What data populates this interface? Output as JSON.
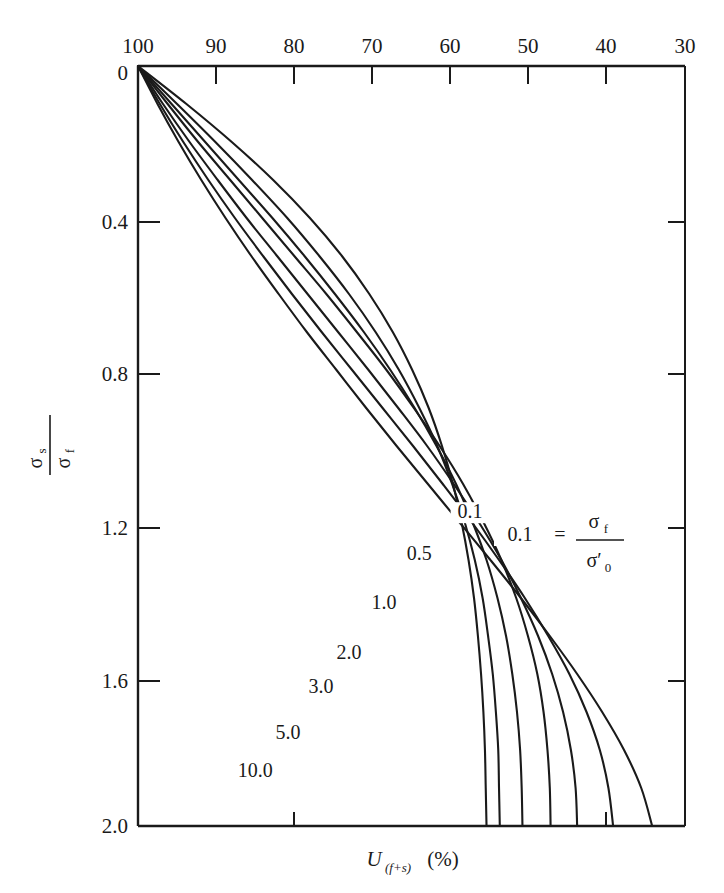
{
  "chart_data": {
    "type": "line",
    "title": "",
    "xlabel": "U(f+s) (%)",
    "ylabel": "sigma_s / sigma_f",
    "x_axis": {
      "position": "top",
      "label_text": "U",
      "label_sub": "(f+s)",
      "label_unit": "(%)",
      "ticks": [
        100,
        90,
        80,
        70,
        60,
        50,
        40,
        30
      ],
      "tick_labels": [
        "100",
        "90",
        "80",
        "70",
        "60",
        "50",
        "40",
        "30"
      ],
      "xlim": [
        100,
        30
      ],
      "inverted": true
    },
    "y_axis": {
      "position": "left",
      "numerator": "σ",
      "numerator_sub": "s",
      "denominator": "σ",
      "denominator_sub": "f",
      "ticks": [
        0,
        0.4,
        0.8,
        1.2,
        1.6,
        2.0
      ],
      "tick_labels": [
        "0",
        "0.4",
        "0.8",
        "1.2",
        "1.6",
        "2.0"
      ],
      "ylim": [
        0,
        2.0
      ],
      "inverted": true
    },
    "grid": false,
    "legend_position": "inline-curve-labels",
    "legend_equation": {
      "value": "0.1",
      "equals": "=",
      "numerator": "σ",
      "numerator_sub": "f",
      "denominator": "σ′",
      "denominator_sub": "0"
    },
    "series": [
      {
        "name": "0.1",
        "label": "0.1",
        "points": [
          [
            100,
            0.0
          ],
          [
            97.5,
            0.1
          ],
          [
            94.8,
            0.2
          ],
          [
            91.9,
            0.3
          ],
          [
            88.8,
            0.4
          ],
          [
            85.5,
            0.5
          ],
          [
            82.0,
            0.6
          ],
          [
            78.4,
            0.7
          ],
          [
            74.6,
            0.8
          ],
          [
            70.8,
            0.9
          ],
          [
            66.9,
            1.0
          ],
          [
            62.9,
            1.1
          ],
          [
            58.9,
            1.2
          ],
          [
            54.9,
            1.3
          ],
          [
            51.0,
            1.4
          ],
          [
            47.3,
            1.5
          ],
          [
            43.8,
            1.6
          ],
          [
            40.6,
            1.7
          ],
          [
            37.8,
            1.8
          ],
          [
            35.6,
            1.9
          ],
          [
            34.2,
            2.0
          ]
        ]
      },
      {
        "name": "0.5",
        "label": "0.5",
        "points": [
          [
            100,
            0.0
          ],
          [
            97.2,
            0.1
          ],
          [
            94.2,
            0.2
          ],
          [
            91.0,
            0.3
          ],
          [
            87.6,
            0.4
          ],
          [
            84.0,
            0.5
          ],
          [
            80.3,
            0.6
          ],
          [
            76.5,
            0.7
          ],
          [
            72.6,
            0.8
          ],
          [
            68.7,
            0.9
          ],
          [
            64.8,
            1.0
          ],
          [
            61.0,
            1.1
          ],
          [
            57.3,
            1.2
          ],
          [
            53.8,
            1.3
          ],
          [
            50.5,
            1.4
          ],
          [
            47.5,
            1.5
          ],
          [
            44.8,
            1.6
          ],
          [
            42.6,
            1.7
          ],
          [
            40.9,
            1.8
          ],
          [
            39.8,
            1.9
          ],
          [
            39.2,
            2.0
          ]
        ]
      },
      {
        "name": "1.0",
        "label": "1.0",
        "points": [
          [
            100,
            0.0
          ],
          [
            96.8,
            0.1
          ],
          [
            93.4,
            0.2
          ],
          [
            89.8,
            0.3
          ],
          [
            86.1,
            0.4
          ],
          [
            82.2,
            0.5
          ],
          [
            78.3,
            0.6
          ],
          [
            74.4,
            0.7
          ],
          [
            70.5,
            0.8
          ],
          [
            66.7,
            0.9
          ],
          [
            63.0,
            1.0
          ],
          [
            59.6,
            1.1
          ],
          [
            56.4,
            1.2
          ],
          [
            53.5,
            1.3
          ],
          [
            51.0,
            1.4
          ],
          [
            48.8,
            1.5
          ],
          [
            47.0,
            1.6
          ],
          [
            45.6,
            1.7
          ],
          [
            44.6,
            1.8
          ],
          [
            44.0,
            1.9
          ],
          [
            43.8,
            2.0
          ]
        ]
      },
      {
        "name": "2.0",
        "label": "2.0",
        "points": [
          [
            100,
            0.0
          ],
          [
            96.2,
            0.1
          ],
          [
            92.3,
            0.2
          ],
          [
            88.2,
            0.3
          ],
          [
            84.1,
            0.4
          ],
          [
            80.0,
            0.5
          ],
          [
            75.9,
            0.6
          ],
          [
            72.0,
            0.7
          ],
          [
            68.2,
            0.8
          ],
          [
            64.7,
            0.9
          ],
          [
            61.4,
            1.0
          ],
          [
            58.4,
            1.1
          ],
          [
            55.8,
            1.2
          ],
          [
            53.5,
            1.3
          ],
          [
            51.6,
            1.4
          ],
          [
            50.1,
            1.5
          ],
          [
            48.9,
            1.6
          ],
          [
            48.1,
            1.7
          ],
          [
            47.6,
            1.8
          ],
          [
            47.3,
            1.9
          ],
          [
            47.2,
            2.0
          ]
        ]
      },
      {
        "name": "3.0",
        "label": "3.0",
        "points": [
          [
            100,
            0.0
          ],
          [
            95.7,
            0.1
          ],
          [
            91.4,
            0.2
          ],
          [
            87.1,
            0.3
          ],
          [
            82.8,
            0.4
          ],
          [
            78.7,
            0.5
          ],
          [
            74.8,
            0.6
          ],
          [
            71.1,
            0.7
          ],
          [
            67.7,
            0.8
          ],
          [
            64.6,
            0.9
          ],
          [
            61.8,
            1.0
          ],
          [
            59.3,
            1.1
          ],
          [
            57.2,
            1.2
          ],
          [
            55.4,
            1.3
          ],
          [
            54.0,
            1.4
          ],
          [
            52.9,
            1.5
          ],
          [
            52.1,
            1.6
          ],
          [
            51.5,
            1.7
          ],
          [
            51.1,
            1.8
          ],
          [
            50.9,
            1.9
          ],
          [
            50.8,
            2.0
          ]
        ]
      },
      {
        "name": "5.0",
        "label": "5.0",
        "points": [
          [
            100,
            0.0
          ],
          [
            95.0,
            0.1
          ],
          [
            90.1,
            0.2
          ],
          [
            85.4,
            0.3
          ],
          [
            80.9,
            0.4
          ],
          [
            76.8,
            0.5
          ],
          [
            73.0,
            0.6
          ],
          [
            69.6,
            0.7
          ],
          [
            66.6,
            0.8
          ],
          [
            64.0,
            0.9
          ],
          [
            61.7,
            1.0
          ],
          [
            59.8,
            1.1
          ],
          [
            58.2,
            1.2
          ],
          [
            56.9,
            1.3
          ],
          [
            55.9,
            1.4
          ],
          [
            55.2,
            1.5
          ],
          [
            54.6,
            1.6
          ],
          [
            54.2,
            1.7
          ],
          [
            53.9,
            1.8
          ],
          [
            53.8,
            1.9
          ],
          [
            53.7,
            2.0
          ]
        ]
      },
      {
        "name": "10.0",
        "label": "10.0",
        "points": [
          [
            100,
            0.0
          ],
          [
            93.8,
            0.1
          ],
          [
            88.0,
            0.2
          ],
          [
            82.7,
            0.3
          ],
          [
            78.0,
            0.4
          ],
          [
            73.9,
            0.5
          ],
          [
            70.4,
            0.6
          ],
          [
            67.4,
            0.7
          ],
          [
            64.9,
            0.8
          ],
          [
            62.8,
            0.9
          ],
          [
            61.1,
            1.0
          ],
          [
            59.7,
            1.1
          ],
          [
            58.6,
            1.2
          ],
          [
            57.7,
            1.3
          ],
          [
            57.0,
            1.4
          ],
          [
            56.5,
            1.5
          ],
          [
            56.1,
            1.6
          ],
          [
            55.8,
            1.7
          ],
          [
            55.6,
            1.8
          ],
          [
            55.5,
            1.9
          ],
          [
            55.4,
            2.0
          ]
        ]
      }
    ],
    "curve_label_positions": [
      {
        "label": "0.1",
        "x": 57.5,
        "y": 1.19
      },
      {
        "label": "0.5",
        "x": 64.0,
        "y": 1.3
      },
      {
        "label": "1.0",
        "x": 68.5,
        "y": 1.43
      },
      {
        "label": "2.0",
        "x": 73.0,
        "y": 1.56
      },
      {
        "label": "3.0",
        "x": 76.6,
        "y": 1.65
      },
      {
        "label": "5.0",
        "x": 80.8,
        "y": 1.77
      },
      {
        "label": "10.0",
        "x": 85.0,
        "y": 1.87
      }
    ]
  },
  "colors": {
    "background": "#ffffff",
    "ink": "#1a1a1a",
    "curve": "#1a1a1a"
  }
}
